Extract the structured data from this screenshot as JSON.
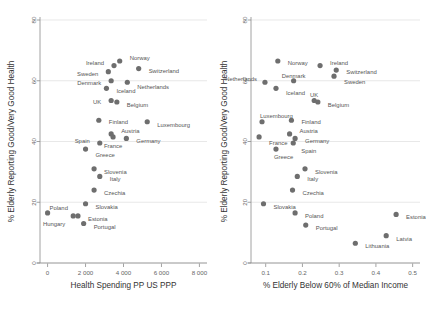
{
  "chart_data": [
    {
      "type": "scatter",
      "panel": "left",
      "title": "",
      "xlabel": "Health Spending PP US PPP",
      "ylabel": "% Elderly Reporting Good/Very Good Health",
      "xlim": [
        -400,
        8400
      ],
      "ylim": [
        0,
        80
      ],
      "xticks": [
        0,
        2000,
        4000,
        6000,
        8000
      ],
      "xticklabels": [
        "0",
        "2 000",
        "4 000",
        "6 000",
        "8 000"
      ],
      "yticks": [
        0,
        20,
        40,
        60,
        80
      ],
      "yticklabels": [
        "0",
        "20",
        "40",
        "60",
        "80"
      ],
      "grid": "horizontal",
      "legend": "none",
      "marker_color": "#6e6e6e",
      "points": [
        {
          "label": "Norway",
          "x": 3800,
          "y": 66.5,
          "lx": 10,
          "ly": -3
        },
        {
          "label": "Ireland",
          "x": 3500,
          "y": 65.0,
          "lx": -10,
          "ly": -3,
          "anchor": "end"
        },
        {
          "label": "Switzerland",
          "x": 4800,
          "y": 64.0,
          "lx": 10,
          "ly": 2
        },
        {
          "label": "Sweden",
          "x": 3200,
          "y": 63.0,
          "lx": -10,
          "ly": 2,
          "anchor": "end"
        },
        {
          "label": "Denmark",
          "x": 3350,
          "y": 60.0,
          "lx": -10,
          "ly": 2,
          "anchor": "end"
        },
        {
          "label": "Netherlands",
          "x": 4200,
          "y": 59.5,
          "lx": 10,
          "ly": 5
        },
        {
          "label": "Iceland",
          "x": 3100,
          "y": 57.5,
          "lx": 10,
          "ly": 3
        },
        {
          "label": "UK",
          "x": 3350,
          "y": 53.5,
          "lx": -10,
          "ly": 2,
          "anchor": "end"
        },
        {
          "label": "Belgium",
          "x": 3650,
          "y": 53.0,
          "lx": 10,
          "ly": 3
        },
        {
          "label": "Finland",
          "x": 2700,
          "y": 47.0,
          "lx": 10,
          "ly": 2
        },
        {
          "label": "Luxembourg",
          "x": 5250,
          "y": 46.5,
          "lx": 10,
          "ly": 3
        },
        {
          "label": "Austria",
          "x": 3350,
          "y": 42.5,
          "lx": 10,
          "ly": -3
        },
        {
          "label": "Germany",
          "x": 4150,
          "y": 41.0,
          "lx": 10,
          "ly": 3
        },
        {
          "label": "France",
          "x": 3450,
          "y": 41.5,
          "lx": 0,
          "ly": 9,
          "anchor": "middle"
        },
        {
          "label": "Spain",
          "x": 2750,
          "y": 39.5,
          "lx": -10,
          "ly": -2,
          "anchor": "end"
        },
        {
          "label": "Greece",
          "x": 2000,
          "y": 37.5,
          "lx": 10,
          "ly": 6
        },
        {
          "label": "Slovenia",
          "x": 2450,
          "y": 31.0,
          "lx": 10,
          "ly": 3
        },
        {
          "label": "Italy",
          "x": 2750,
          "y": 28.5,
          "lx": 10,
          "ly": 3
        },
        {
          "label": "Czechia",
          "x": 2450,
          "y": 24.0,
          "lx": 10,
          "ly": 3
        },
        {
          "label": "Slovakia",
          "x": 2000,
          "y": 19.5,
          "lx": 10,
          "ly": 3
        },
        {
          "label": "Poland",
          "x": 0,
          "y": 16.5,
          "lx": 2,
          "ly": -5,
          "anchor": "start"
        },
        {
          "label": "Estonia",
          "x": 1600,
          "y": 15.5,
          "lx": 10,
          "ly": 3
        },
        {
          "label": "Hungary",
          "x": 1350,
          "y": 15.5,
          "lx": -8,
          "ly": 8,
          "anchor": "end"
        },
        {
          "label": "Portugal",
          "x": 1900,
          "y": 13.0,
          "lx": 10,
          "ly": 3
        }
      ]
    },
    {
      "type": "scatter",
      "panel": "right",
      "title": "",
      "xlabel": "% Elderly Below 60% of Median Income",
      "ylabel": "% Elderly Reporting Good/Very Good Health",
      "xlim": [
        0.06,
        0.52
      ],
      "ylim": [
        0,
        80
      ],
      "xticks": [
        0.1,
        0.2,
        0.3,
        0.4,
        0.5
      ],
      "xticklabels": [
        "0.1",
        "0.2",
        "0.3",
        "0.4",
        "0.5"
      ],
      "yticks": [
        0,
        20,
        40,
        60,
        80
      ],
      "yticklabels": [
        "0",
        "20",
        "40",
        "60",
        "80"
      ],
      "grid": "horizontal",
      "legend": "none",
      "marker_color": "#6e6e6e",
      "points": [
        {
          "label": "Norway",
          "x": 0.133,
          "y": 66.5,
          "lx": 10,
          "ly": 2
        },
        {
          "label": "Ireland",
          "x": 0.248,
          "y": 65.0,
          "lx": 10,
          "ly": -3
        },
        {
          "label": "Switzerland",
          "x": 0.292,
          "y": 63.5,
          "lx": 10,
          "ly": 2
        },
        {
          "label": "Sweden",
          "x": 0.286,
          "y": 61.5,
          "lx": 10,
          "ly": 6
        },
        {
          "label": "Denmark",
          "x": 0.176,
          "y": 60.0,
          "lx": 0,
          "ly": -5,
          "anchor": "middle"
        },
        {
          "label": "Netherlands",
          "x": 0.098,
          "y": 59.5,
          "lx": -8,
          "ly": -3,
          "anchor": "end"
        },
        {
          "label": "Iceland",
          "x": 0.128,
          "y": 57.5,
          "lx": 10,
          "ly": 5
        },
        {
          "label": "UK",
          "x": 0.232,
          "y": 53.5,
          "lx": 0,
          "ly": -5,
          "anchor": "middle"
        },
        {
          "label": "Belgium",
          "x": 0.242,
          "y": 53.0,
          "lx": 10,
          "ly": 3
        },
        {
          "label": "Luxembourg",
          "x": 0.09,
          "y": 46.5,
          "lx": -2,
          "ly": -6,
          "anchor": "start"
        },
        {
          "label": "Finland",
          "x": 0.17,
          "y": 47.0,
          "lx": 10,
          "ly": 2
        },
        {
          "label": "Austria",
          "x": 0.165,
          "y": 42.5,
          "lx": 10,
          "ly": -3
        },
        {
          "label": "Germany",
          "x": 0.18,
          "y": 41.0,
          "lx": 10,
          "ly": 3
        },
        {
          "label": "France",
          "x": 0.082,
          "y": 41.5,
          "lx": 10,
          "ly": 6
        },
        {
          "label": "Spain",
          "x": 0.175,
          "y": 39.5,
          "lx": 8,
          "ly": 8
        },
        {
          "label": "Greece",
          "x": 0.128,
          "y": 37.5,
          "lx": -2,
          "ly": 8,
          "anchor": "start"
        },
        {
          "label": "Slovenia",
          "x": 0.207,
          "y": 31.0,
          "lx": 10,
          "ly": 3
        },
        {
          "label": "Italy",
          "x": 0.186,
          "y": 28.5,
          "lx": 10,
          "ly": 3
        },
        {
          "label": "Czechia",
          "x": 0.173,
          "y": 24.0,
          "lx": 10,
          "ly": 3
        },
        {
          "label": "Slovakia",
          "x": 0.094,
          "y": 19.5,
          "lx": 10,
          "ly": 3
        },
        {
          "label": "Poland",
          "x": 0.18,
          "y": 16.5,
          "lx": 10,
          "ly": 3
        },
        {
          "label": "Estonia",
          "x": 0.455,
          "y": 16.0,
          "lx": 10,
          "ly": 3
        },
        {
          "label": "Portugal",
          "x": 0.209,
          "y": 12.5,
          "lx": 10,
          "ly": 3
        },
        {
          "label": "Latvia",
          "x": 0.428,
          "y": 9.0,
          "lx": 10,
          "ly": 3
        },
        {
          "label": "Lithuania",
          "x": 0.344,
          "y": 6.5,
          "lx": 10,
          "ly": 3
        }
      ]
    }
  ]
}
